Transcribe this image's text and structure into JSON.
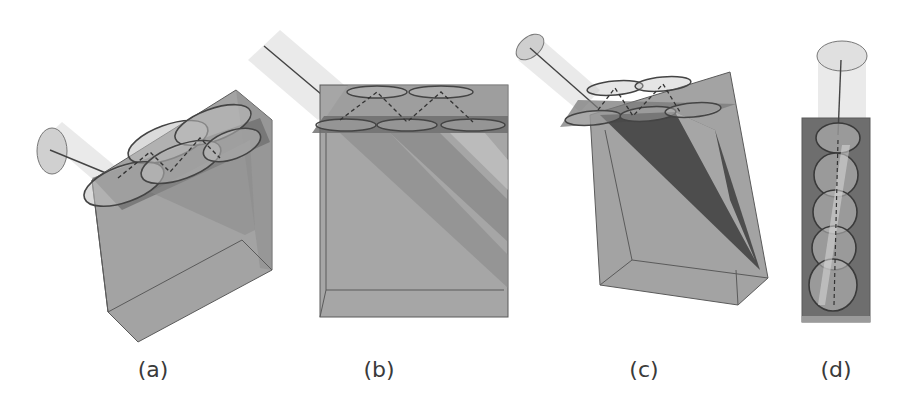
{
  "figure": {
    "panels": [
      {
        "id": "a",
        "label": "(a)",
        "description": "Tilted translucent box with beam cylinder entering from left; four elliptical spots on top layer with dashed zigzag path"
      },
      {
        "id": "b",
        "label": "(b)",
        "description": "Front-facing translucent box with beam from upper-left; two rows of ellipses on top slab with dashed zigzag; diagonal shaded bands inside"
      },
      {
        "id": "c",
        "label": "(c)",
        "description": "Perspective-skewed box with beam from upper-left; ellipses on top slab; dark diagonal wedge of rays inside"
      },
      {
        "id": "d",
        "label": "(d)",
        "description": "Narrow vertical box viewed from top; beam cylinder from above; stacked circular spots down the column"
      }
    ],
    "colors": {
      "box_fill": "#9a9a9a",
      "box_edge": "#5a5a5a",
      "slab_fill": "#6f6f6f",
      "beam_fill": "#e6e6e6",
      "ellipse_stroke": "#4a4a4a",
      "label_color": "#3a3a3a"
    }
  }
}
